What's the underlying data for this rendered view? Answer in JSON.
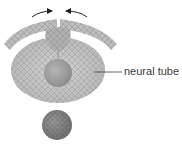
{
  "diagram": {
    "labels": [
      {
        "id": "neural-tube",
        "text": "neural tube"
      }
    ],
    "colors": {
      "background": "#ffffff",
      "ectoderm": "#b9b9b9",
      "neural_tube": "#c4c4c4",
      "lumen": "#9c9c9c",
      "neural_crest": "#aaaaaa",
      "notochord": "#8a8a8a",
      "cell_lines": "#8f8f8f",
      "arrows": "#222222",
      "label_text": "#3a3a3a"
    },
    "arrows": [
      {
        "direction": "right",
        "meaning": "fold closing toward midline"
      },
      {
        "direction": "left",
        "meaning": "fold closing toward midline"
      }
    ]
  }
}
